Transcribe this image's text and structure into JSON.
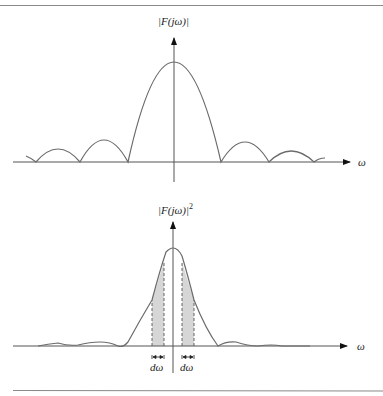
{
  "figure": {
    "top_plot": {
      "y_label": "|F(jω)|",
      "x_label": "ω",
      "description": "Magnitude spectrum: main lobe with decaying side lobes"
    },
    "bottom_plot": {
      "y_label": "|F(jω)|",
      "y_label_exponent": "2",
      "x_label": "ω",
      "band_label_left": "dω",
      "band_label_right": "dω",
      "description": "Energy spectral density with two shaded bands of width dω"
    }
  },
  "colors": {
    "curve": "#6b6b6b",
    "axis": "#555555",
    "shade": "#d6d6d6",
    "rule": "#8a8a8a"
  }
}
